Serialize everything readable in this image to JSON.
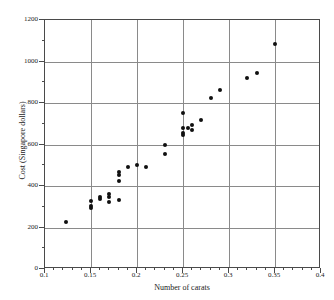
{
  "chart_data": {
    "type": "scatter",
    "title": "",
    "xlabel": "Number of carats",
    "ylabel": "Cost (Singapore dollars)",
    "xlim": [
      0.1,
      0.4
    ],
    "ylim": [
      0,
      1200
    ],
    "xticks": [
      0.1,
      0.15,
      0.2,
      0.25,
      0.3,
      0.35,
      0.4
    ],
    "xtick_labels": [
      "0.1",
      "0.15",
      "0.2",
      "0.25",
      "0.3",
      "0.35",
      "0.4"
    ],
    "yticks": [
      0,
      200,
      400,
      600,
      800,
      1000,
      1200
    ],
    "ytick_labels": [
      "0",
      "200",
      "400",
      "600",
      "800",
      "1000",
      "1200"
    ],
    "x_minor_interval": 0.01,
    "y_minor_interval": 100,
    "grid": true,
    "grid_color": "#8a8a8a",
    "marker_color": "#101010",
    "marker": "filled-circle",
    "legend": null,
    "series": [
      {
        "name": "Diamond rings",
        "points": [
          {
            "x": 0.123,
            "y": 225
          },
          {
            "x": 0.15,
            "y": 328
          },
          {
            "x": 0.15,
            "y": 305
          },
          {
            "x": 0.15,
            "y": 294
          },
          {
            "x": 0.16,
            "y": 345
          },
          {
            "x": 0.16,
            "y": 338
          },
          {
            "x": 0.17,
            "y": 360
          },
          {
            "x": 0.17,
            "y": 348
          },
          {
            "x": 0.17,
            "y": 325
          },
          {
            "x": 0.18,
            "y": 332
          },
          {
            "x": 0.18,
            "y": 469
          },
          {
            "x": 0.18,
            "y": 455
          },
          {
            "x": 0.18,
            "y": 423
          },
          {
            "x": 0.19,
            "y": 492
          },
          {
            "x": 0.2,
            "y": 503
          },
          {
            "x": 0.21,
            "y": 491
          },
          {
            "x": 0.23,
            "y": 600
          },
          {
            "x": 0.23,
            "y": 556
          },
          {
            "x": 0.25,
            "y": 750
          },
          {
            "x": 0.25,
            "y": 679
          },
          {
            "x": 0.25,
            "y": 655
          },
          {
            "x": 0.25,
            "y": 644
          },
          {
            "x": 0.255,
            "y": 678
          },
          {
            "x": 0.26,
            "y": 696
          },
          {
            "x": 0.26,
            "y": 669
          },
          {
            "x": 0.27,
            "y": 720
          },
          {
            "x": 0.28,
            "y": 825
          },
          {
            "x": 0.29,
            "y": 862
          },
          {
            "x": 0.32,
            "y": 920
          },
          {
            "x": 0.33,
            "y": 945
          },
          {
            "x": 0.35,
            "y": 1086
          }
        ]
      }
    ]
  }
}
